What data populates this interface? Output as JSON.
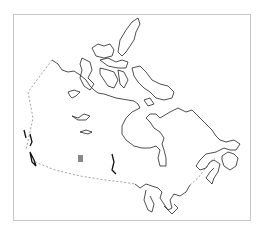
{
  "map": {
    "subject": "Canada outline map",
    "frame_color": "#c8c8c8",
    "coastline_color": "#222222",
    "border_color": "#777777",
    "marker": {
      "shape": "square",
      "color": "#888888",
      "x": 78,
      "y": 155,
      "width": 5,
      "height": 7
    }
  }
}
